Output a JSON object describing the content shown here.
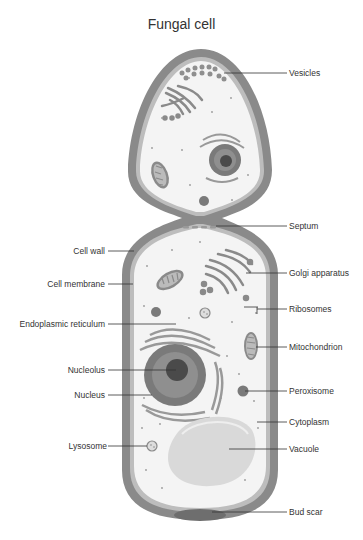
{
  "title": "Fungal cell",
  "colors": {
    "cell_wall": "#8a8a8a",
    "cell_membrane": "#b8b8b8",
    "cytoplasm": "#f4f4f4",
    "organelle_dark": "#7a7a7a",
    "organelle_mid": "#999999",
    "nucleolus": "#4a4a4a",
    "vacuole": "#dcdcdc",
    "leader_line": "#333333"
  },
  "labels": {
    "right": [
      {
        "id": "vesicles",
        "text": "Vesicles"
      },
      {
        "id": "septum",
        "text": "Septum"
      },
      {
        "id": "golgi",
        "text": "Golgi apparatus"
      },
      {
        "id": "ribosomes",
        "text": "Ribosomes"
      },
      {
        "id": "mitochondrion",
        "text": "Mitochondrion"
      },
      {
        "id": "peroxisome",
        "text": "Peroxisome"
      },
      {
        "id": "cytoplasm",
        "text": "Cytoplasm"
      },
      {
        "id": "vacuole",
        "text": "Vacuole"
      },
      {
        "id": "bud_scar",
        "text": "Bud scar"
      }
    ],
    "left": [
      {
        "id": "cell_wall",
        "text": "Cell wall"
      },
      {
        "id": "cell_membrane",
        "text": "Cell membrane"
      },
      {
        "id": "endoplasmic_reticulum",
        "text": "Endoplasmic reticulum"
      },
      {
        "id": "nucleolus",
        "text": "Nucleolus"
      },
      {
        "id": "nucleus",
        "text": "Nucleus"
      },
      {
        "id": "lysosome",
        "text": "Lysosome"
      }
    ]
  }
}
